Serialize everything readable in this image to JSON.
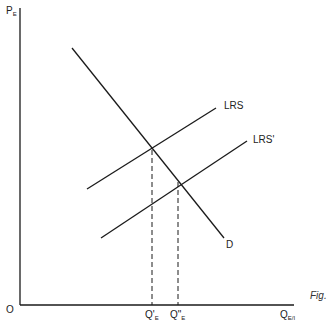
{
  "diagram": {
    "type": "supply-demand",
    "axes": {
      "y_label": "P",
      "y_label_sub": "E",
      "x_label": "Q",
      "x_label_sub": "E/I",
      "origin_label": "O"
    },
    "curves": [
      {
        "id": "D",
        "label": "D",
        "kind": "demand"
      },
      {
        "id": "LRS",
        "label": "LRS",
        "kind": "supply"
      },
      {
        "id": "LRS2",
        "label": "LRS'",
        "kind": "supply"
      }
    ],
    "x_ticks": [
      {
        "main": "Q'",
        "sub": "E"
      },
      {
        "main": "Q\"",
        "sub": "E"
      }
    ],
    "caption": "Fig."
  },
  "colors": {
    "line": "#1a1a1a",
    "background": "#ffffff"
  }
}
